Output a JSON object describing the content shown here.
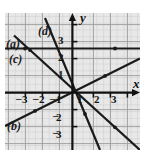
{
  "figure": {
    "kind": "coordinate-grid-graph",
    "background": "#e8e8e8",
    "grid_color": "#b5b5b5",
    "minor_grid_color": "#cfcfcf",
    "axis_color": "#1a1a1a",
    "line_color": "#1a1a1a",
    "axis_labels": {
      "x": "x",
      "y": "y"
    },
    "x_ticks": [
      {
        "value": -3,
        "label": "3"
      },
      {
        "value": -2,
        "label": "2"
      },
      {
        "value": -1,
        "label": "1"
      },
      {
        "value": 1,
        "label": "1"
      },
      {
        "value": 2,
        "label": "2"
      },
      {
        "value": 3,
        "label": "3"
      }
    ],
    "y_ticks": [
      {
        "value": 3,
        "label": "3"
      },
      {
        "value": 2,
        "label": "2"
      },
      {
        "value": 1,
        "label": "1"
      },
      {
        "value": -2,
        "label": "2"
      },
      {
        "value": -3,
        "label": "3"
      }
    ],
    "curve_labels": [
      {
        "id": "a",
        "text": "(a)"
      },
      {
        "id": "b",
        "text": "(b)"
      },
      {
        "id": "c",
        "text": "(c)"
      },
      {
        "id": "d",
        "text": "(d)"
      }
    ],
    "lines": [
      {
        "id": "a",
        "description": "horizontal line",
        "slope": 0,
        "intercept": 2.6
      },
      {
        "id": "b",
        "description": "gentle positive slope line",
        "slope": 0.5,
        "intercept": 0
      },
      {
        "id": "c",
        "description": "negative slope line",
        "slope": -1.2,
        "intercept": 0
      },
      {
        "id": "d",
        "description": "steep negative slope line",
        "slope": -3,
        "intercept": 0
      }
    ]
  }
}
